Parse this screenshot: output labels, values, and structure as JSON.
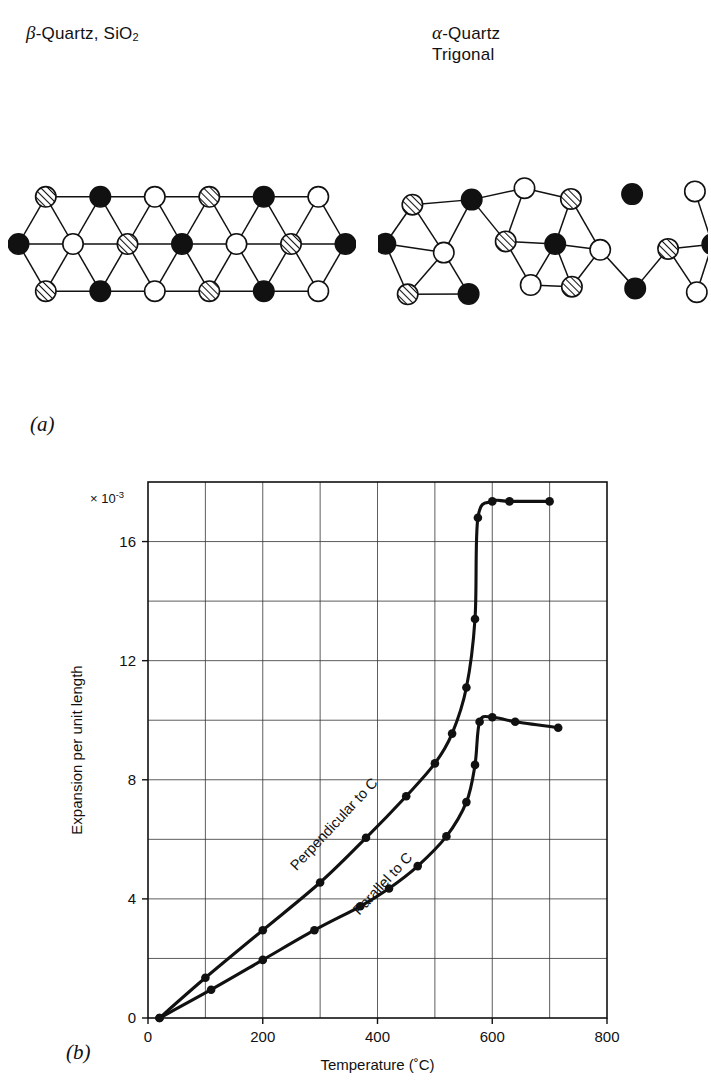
{
  "figure": {
    "panel_a_label": "(a)",
    "panel_b_label": "(b)",
    "left_structure": {
      "title_prefix": "β",
      "title_rest": "-Quartz, SiO",
      "title_sub": "2",
      "atom_types": [
        "filled-black",
        "open-white",
        "hatched"
      ]
    },
    "right_structure": {
      "title_prefix": "α",
      "title_rest": "-Quartz",
      "subtitle": "Trigonal",
      "atom_types": [
        "filled-black",
        "open-white",
        "hatched"
      ]
    }
  },
  "chart_data": {
    "type": "line",
    "title": "",
    "xlabel": "Temperature (˚C)",
    "ylabel": "Expansion per unit length",
    "y_exponent_label": "× 10",
    "y_exponent_sup": "-3",
    "xlim": [
      0,
      800
    ],
    "ylim": [
      0,
      18
    ],
    "xticks": [
      0,
      200,
      400,
      600,
      800
    ],
    "xticklabels": [
      "0",
      "200",
      "400",
      "600",
      "800"
    ],
    "x_minor_step": 100,
    "yticks": [
      0,
      4,
      8,
      12,
      16
    ],
    "yticklabels": [
      "0",
      "4",
      "8",
      "12",
      "16"
    ],
    "y_minor_step": 2,
    "grid": true,
    "legend": "inline-labels",
    "series": [
      {
        "name": "Perpendicular to C",
        "label": "Perpendicular to C",
        "x": [
          20,
          100,
          200,
          300,
          380,
          450,
          500,
          530,
          555,
          570,
          575,
          600,
          630,
          700
        ],
        "y": [
          0.0,
          1.35,
          2.95,
          4.55,
          6.05,
          7.45,
          8.55,
          9.55,
          11.1,
          13.4,
          16.8,
          17.35,
          17.35,
          17.35
        ]
      },
      {
        "name": "Parallel to C",
        "label": "Parallel to C",
        "x": [
          20,
          110,
          200,
          290,
          370,
          420,
          470,
          520,
          555,
          570,
          578,
          600,
          640,
          715
        ],
        "y": [
          0.0,
          0.95,
          1.95,
          2.95,
          3.75,
          4.35,
          5.1,
          6.1,
          7.25,
          8.5,
          9.95,
          10.1,
          9.95,
          9.75
        ]
      }
    ],
    "annotations": [
      {
        "text": "Perpendicular to C",
        "at_x": 330,
        "at_y": 6.4
      },
      {
        "text": "Parallel to C",
        "at_x": 415,
        "at_y": 4.4
      }
    ]
  }
}
